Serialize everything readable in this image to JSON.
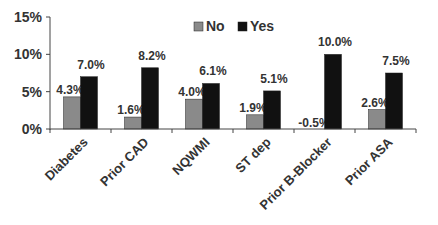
{
  "chart_data": {
    "type": "bar",
    "title": "",
    "xlabel": "",
    "ylabel": "",
    "ylim": [
      0,
      15
    ],
    "yticks": [
      "0%",
      "5%",
      "10%",
      "15%"
    ],
    "grid": false,
    "legend_position": "top-right",
    "categories": [
      "Diabetes",
      "Prior CAD",
      "NQWMI",
      "ST dep",
      "Prior B-Blocker",
      "Prior ASA"
    ],
    "series": [
      {
        "name": "No",
        "color": "#8a8a8a",
        "values": [
          4.3,
          1.6,
          4.0,
          1.9,
          -0.5,
          2.6
        ],
        "labels": [
          "4.3%",
          "1.6%",
          "4.0%",
          "1.9%",
          "-0.5%",
          "2.6%"
        ]
      },
      {
        "name": "Yes",
        "color": "#111111",
        "values": [
          7.0,
          8.2,
          6.1,
          5.1,
          10.0,
          7.5
        ],
        "labels": [
          "7.0%",
          "8.2%",
          "6.1%",
          "5.1%",
          "10.0%",
          "7.5%"
        ]
      }
    ]
  }
}
